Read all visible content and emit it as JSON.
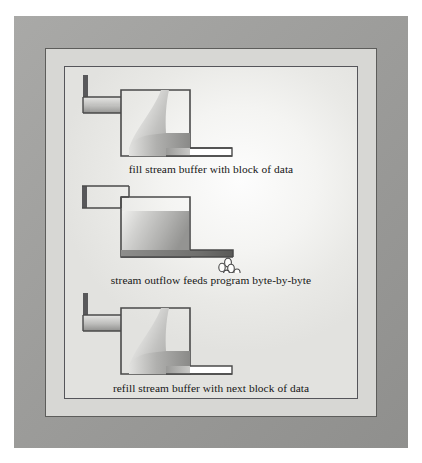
{
  "figure": {
    "title_visible": false,
    "background_color": "#ffffff",
    "frame": {
      "outer_color": "#9d9d9b",
      "mid_color": "#d7d7d4",
      "border_color": "#55555a",
      "panel_color": "#f3f3f1"
    }
  },
  "diagrams": [
    {
      "id": "fill",
      "caption": "fill stream buffer with block of data",
      "inlet_flowing": true,
      "tank_state": "filling",
      "outlet_dripping": false,
      "droplet_count": 0
    },
    {
      "id": "outflow",
      "caption": "stream outflow feeds program byte-by-byte",
      "inlet_flowing": false,
      "tank_state": "full",
      "outlet_dripping": true,
      "droplet_count": 5
    },
    {
      "id": "refill",
      "caption": "refill stream buffer with next block of data",
      "inlet_flowing": true,
      "tank_state": "filling",
      "outlet_dripping": false,
      "droplet_count": 0
    }
  ],
  "colors": {
    "outline": "#4a4a4a",
    "fluid_light": "#f0f0ee",
    "fluid_mid": "#b9b9b7",
    "fluid_dark": "#8b8b89",
    "caption_text": "#161616"
  }
}
